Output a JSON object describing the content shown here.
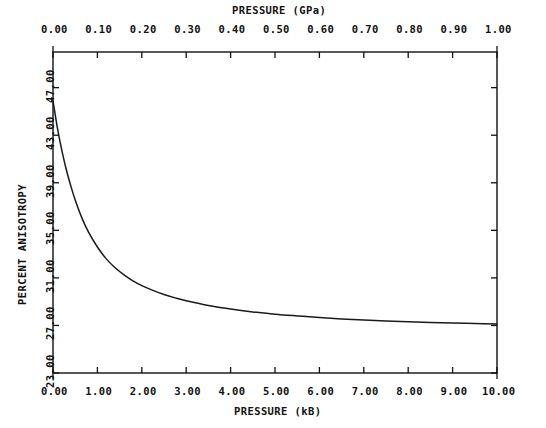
{
  "chart_data": {
    "type": "line",
    "title": "",
    "top_axis": {
      "label": "PRESSURE  (GPa)",
      "ticks": [
        "0.00",
        "0.10",
        "0.20",
        "0.30",
        "0.40",
        "0.50",
        "0.60",
        "0.70",
        "0.80",
        "0.90",
        "1.00"
      ],
      "values": [
        0.0,
        0.1,
        0.2,
        0.3,
        0.4,
        0.5,
        0.6,
        0.7,
        0.8,
        0.9,
        1.0
      ],
      "range": [
        0.0,
        1.0
      ]
    },
    "xlabel": "PRESSURE  (kB)",
    "x_ticks": [
      "0.00",
      "1.00",
      "2.00",
      "3.00",
      "4.00",
      "5.00",
      "6.00",
      "7.00",
      "8.00",
      "9.00",
      "10.00"
    ],
    "x_values": [
      0,
      1,
      2,
      3,
      4,
      5,
      6,
      7,
      8,
      9,
      10
    ],
    "xlim": [
      0,
      10
    ],
    "ylabel": "PERCENT ANISOTROPY",
    "y_ticks": [
      "23.00",
      "27.00",
      "31.00",
      "35.00",
      "39.00",
      "43.00",
      "47.00"
    ],
    "y_values": [
      23,
      27,
      31,
      35,
      39,
      43,
      47
    ],
    "ylim": [
      23,
      50
    ],
    "grid": false,
    "legend": null,
    "series": [
      {
        "name": "percent anisotropy vs pressure",
        "color": "#1a1a1a",
        "x": [
          0.0,
          0.1,
          0.2,
          0.3,
          0.4,
          0.5,
          0.65,
          0.8,
          1.0,
          1.2,
          1.4,
          1.6,
          1.8,
          2.0,
          2.25,
          2.5,
          2.75,
          3.0,
          3.5,
          4.0,
          4.5,
          5.0,
          5.5,
          6.0,
          6.5,
          7.0,
          7.5,
          8.0,
          8.5,
          9.0,
          9.5,
          10.0
        ],
        "y": [
          45.9,
          43.6,
          41.7,
          40.1,
          38.75,
          37.55,
          36.05,
          34.85,
          33.6,
          32.6,
          31.85,
          31.25,
          30.75,
          30.35,
          29.95,
          29.6,
          29.32,
          29.08,
          28.68,
          28.38,
          28.14,
          27.95,
          27.8,
          27.66,
          27.55,
          27.46,
          27.38,
          27.31,
          27.25,
          27.2,
          27.16,
          27.12
        ]
      }
    ]
  },
  "layout": {
    "plot_left": 53,
    "plot_right": 497,
    "plot_top": 52,
    "plot_bottom": 373
  }
}
